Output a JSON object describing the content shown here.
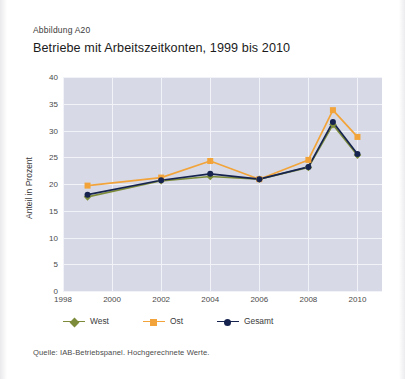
{
  "figure_number": "Abbildung A20",
  "title": "Betriebe mit Arbeitszeitkonten, 1999 bis 2010",
  "source": "Quelle: IAB-Betriebspanel. Hochgerechnete Werte.",
  "colors": {
    "west": "#7d8c3a",
    "ost": "#f2a43a",
    "gesamt": "#16234f",
    "plot_background": "#d7dae6",
    "gridline": "#f2f3f8"
  },
  "legend": [
    {
      "label": "West",
      "color": "#7d8c3a",
      "marker": "diamond"
    },
    {
      "label": "Ost",
      "color": "#f2a43a",
      "marker": "square"
    },
    {
      "label": "Gesamt",
      "color": "#16234f",
      "marker": "circle"
    }
  ],
  "chart_data": {
    "type": "line",
    "title": "Betriebe mit Arbeitszeitkonten, 1999 bis 2010",
    "xlabel": "",
    "ylabel": "Anteil in Prozent",
    "xlim": [
      1998,
      2011
    ],
    "ylim": [
      0,
      40
    ],
    "yticks": [
      0,
      5,
      10,
      15,
      20,
      25,
      30,
      35,
      40
    ],
    "ytick_labels": [
      "0",
      "5",
      "10",
      "15",
      "20",
      "25",
      "30",
      "35",
      "40"
    ],
    "xticks": [
      1998,
      2000,
      2002,
      2004,
      2006,
      2008,
      2010
    ],
    "xtick_labels": [
      "1998",
      "2000",
      "2002",
      "2004",
      "2006",
      "2008",
      "2010"
    ],
    "grid": true,
    "legend_position": "below",
    "x": [
      1999,
      2002,
      2004,
      2006,
      2008,
      2009,
      2010
    ],
    "series": [
      {
        "name": "West",
        "color": "#7d8c3a",
        "marker": "diamond",
        "values": [
          17.6,
          20.6,
          21.4,
          20.9,
          23.1,
          31.1,
          25.4
        ]
      },
      {
        "name": "Ost",
        "color": "#f2a43a",
        "marker": "square",
        "values": [
          19.7,
          21.2,
          24.3,
          20.9,
          24.5,
          33.8,
          28.8
        ]
      },
      {
        "name": "Gesamt",
        "color": "#16234f",
        "marker": "circle",
        "values": [
          18.0,
          20.7,
          21.9,
          20.9,
          23.2,
          31.6,
          25.6
        ]
      }
    ]
  }
}
